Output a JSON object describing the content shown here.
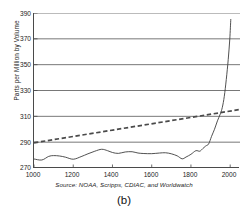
{
  "figure": {
    "panel_label": "(b)",
    "source_note": "Source: NOAA, Scripps, CDIAC, and Worldwatch"
  },
  "chart_data": {
    "type": "line",
    "title": "",
    "subtitle": "",
    "xlabel": "",
    "ylabel": "Parts per Million by Volume",
    "xlim": [
      1000,
      2050
    ],
    "ylim": [
      270,
      390
    ],
    "xticks": [
      1000,
      1200,
      1400,
      1600,
      1800,
      2000
    ],
    "yticks": [
      270,
      290,
      310,
      330,
      350,
      370,
      390
    ],
    "xtick_labels": [
      "1000",
      "1200",
      "1400",
      "1600",
      "1800",
      "2000"
    ],
    "ytick_labels": [
      "270",
      "290",
      "310",
      "330",
      "350",
      "370",
      "390"
    ],
    "grid": "horizontal",
    "legend": "none",
    "annotations": [
      "Source: NOAA, Scripps, CDIAC, and Worldwatch",
      "(b)"
    ],
    "series": [
      {
        "name": "Atmospheric CO2 concentration",
        "style": "solid",
        "color": "#3d3d3d",
        "x": [
          1000,
          1040,
          1075,
          1100,
          1130,
          1160,
          1200,
          1240,
          1275,
          1310,
          1345,
          1375,
          1400,
          1430,
          1465,
          1500,
          1530,
          1560,
          1600,
          1640,
          1670,
          1700,
          1730,
          1755,
          1775,
          1800,
          1825,
          1845,
          1860,
          1875,
          1890,
          1905,
          1920,
          1935,
          1950,
          1960,
          1970,
          1980,
          1990,
          1998,
          2003
        ],
        "y": [
          277.0,
          276.2,
          279.0,
          279.6,
          279.3,
          278.4,
          276.8,
          278.8,
          281.0,
          283.0,
          284.5,
          283.4,
          282.0,
          281.3,
          282.4,
          282.6,
          281.6,
          281.2,
          281.1,
          281.6,
          281.8,
          281.0,
          279.4,
          277.1,
          278.5,
          280.6,
          283.4,
          283.0,
          285.0,
          287.0,
          288.6,
          294.5,
          300.0,
          306.5,
          312.0,
          317.0,
          325.5,
          338.5,
          354.0,
          370.0,
          385.0
        ]
      },
      {
        "name": "Linear trend",
        "style": "dashed",
        "color": "#4a4a4a",
        "x": [
          1000,
          2050
        ],
        "y": [
          289.5,
          315.3
        ]
      }
    ]
  },
  "axes": {
    "y_title": "Parts per Million by Volume"
  }
}
